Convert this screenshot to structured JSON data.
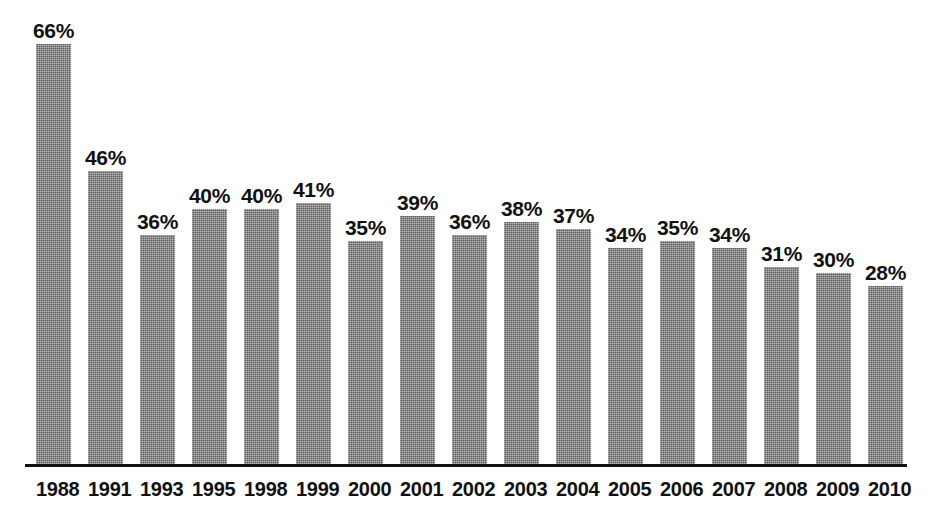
{
  "chart_data": {
    "type": "bar",
    "title": "",
    "subtitle": "",
    "xlabel": "",
    "ylabel": "",
    "categories": [
      "1988",
      "1991",
      "1993",
      "1995",
      "1998",
      "1999",
      "2000",
      "2001",
      "2002",
      "2003",
      "2004",
      "2005",
      "2006",
      "2007",
      "2008",
      "2009",
      "2010"
    ],
    "values": [
      66,
      46,
      36,
      40,
      40,
      41,
      35,
      39,
      36,
      38,
      37,
      34,
      35,
      34,
      31,
      30,
      28
    ],
    "value_labels": [
      "66%",
      "46%",
      "36%",
      "40%",
      "40%",
      "41%",
      "35%",
      "39%",
      "36%",
      "38%",
      "37%",
      "34%",
      "35%",
      "34%",
      "31%",
      "30%",
      "28%"
    ],
    "ylim": [
      0,
      66
    ],
    "unit": "%",
    "grid": false,
    "legend": null,
    "legend_position": "none",
    "annotations": [],
    "bar_color": "#5b5b5b",
    "axis_color": "#111111",
    "label_color": "#111111",
    "background_color": "#ffffff"
  },
  "figure": {
    "title_remnant": "",
    "axis_name": "category-axis"
  }
}
